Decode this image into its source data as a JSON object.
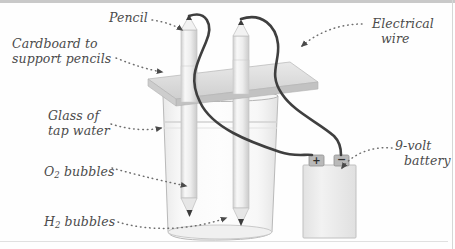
{
  "figure": {
    "background_color": "#fefefe",
    "label_color": "#4b4b4b",
    "wire_color": "#3f3f3f",
    "cardboard_color": "#d8d8d8",
    "glass_color": "#ededed",
    "pencil_color": "#efefef",
    "battery_color": "#ececec"
  },
  "labels": {
    "pencil": "Pencil",
    "cardboard_line1": "Cardboard to",
    "cardboard_line2": "support pencils",
    "glass_line1": "Glass of",
    "glass_line2": "tap water",
    "o2_prefix": "O",
    "o2_sub": "2",
    "o2_suffix": " bubbles",
    "h2_prefix": "H",
    "h2_sub": "2",
    "h2_suffix": " bubbles",
    "wire_line1": "Electrical",
    "wire_line2": "wire",
    "battery_line1": "9-volt",
    "battery_line2": "battery"
  },
  "battery": {
    "positive_terminal": "+",
    "negative_terminal": "−"
  }
}
